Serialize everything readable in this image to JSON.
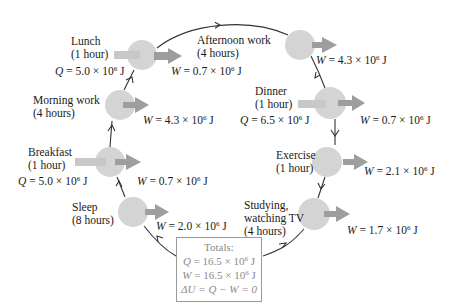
{
  "colors": {
    "circle_fill": "#d4d4d4",
    "input_arrow": "#c8c8c8",
    "output_arrow": "#9a9a9a",
    "cycle_line": "#333333",
    "totals_text": "#8a8a8a",
    "totals_border": "#9a9a9a"
  },
  "stages": [
    {
      "id": "lunch",
      "name": "Lunch",
      "duration": "(1 hour)",
      "q": "5.0",
      "w": "0.7"
    },
    {
      "id": "afternoon-work",
      "name": "Afternoon work",
      "duration": "(4 hours)",
      "w": "4.3"
    },
    {
      "id": "dinner",
      "name": "Dinner",
      "duration": "(1 hour)",
      "q": "6.5",
      "w": "0.7"
    },
    {
      "id": "exercise",
      "name": "Exercise",
      "duration": "(1 hour)",
      "w": "2.1"
    },
    {
      "id": "studying",
      "name": "Studying,",
      "name2": "watching TV",
      "duration": "(4 hours)",
      "w": "1.7"
    },
    {
      "id": "sleep",
      "name": "Sleep",
      "duration": "(8 hours)",
      "w": "2.0"
    },
    {
      "id": "breakfast",
      "name": "Breakfast",
      "duration": "(1 hour)",
      "q": "5.0",
      "w": "0.7"
    },
    {
      "id": "morning-work",
      "name": "Morning work",
      "duration": "(4 hours)",
      "w": "4.3"
    }
  ],
  "symbols": {
    "Q": "Q",
    "W": "W",
    "eq": " = ",
    "times": " × 10",
    "exp": "6",
    "unit": " J"
  },
  "totals": {
    "title": "Totals:",
    "q_line_pre": "Q",
    "q_line_val": " = 16.5 × 10",
    "w_line_pre": "W",
    "w_line_val": " = 16.5 × 10",
    "exp": "6",
    "unit": " J",
    "du_line": "ΔU = Q − W = 0"
  }
}
